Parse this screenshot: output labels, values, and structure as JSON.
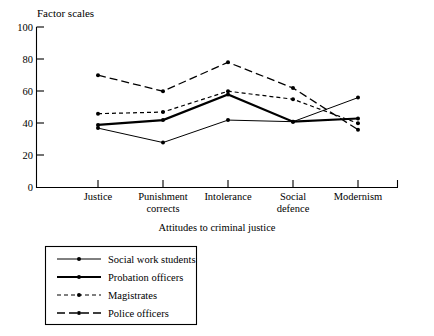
{
  "chart_data": {
    "type": "line",
    "title": "",
    "ylabel": "Factor scales",
    "xlabel": "Attitudes to criminal justice",
    "ylim": [
      0,
      100
    ],
    "yticks": [
      0,
      20,
      40,
      60,
      80,
      100
    ],
    "ytick_labels": [
      "0",
      "20",
      "40",
      "60",
      "80",
      "100"
    ],
    "grid": false,
    "legend_position": "below-left",
    "categories": [
      "Justice",
      "Punishment corrects",
      "Intolerance",
      "Social defence",
      "Modernism"
    ],
    "category_lines": [
      [
        "Justice"
      ],
      [
        "Punishment",
        "corrects"
      ],
      [
        "Intolerance"
      ],
      [
        "Social",
        "defence"
      ],
      [
        "Modernism"
      ]
    ],
    "series": [
      {
        "name": "Social work students",
        "style": "solid-thin",
        "values": [
          37,
          28,
          42,
          41,
          56
        ]
      },
      {
        "name": "Probation officers",
        "style": "solid-thick",
        "values": [
          39,
          42,
          58,
          41,
          43
        ]
      },
      {
        "name": "Magistrates",
        "style": "dashed-short",
        "values": [
          46,
          47,
          60,
          55,
          40
        ]
      },
      {
        "name": "Police officers",
        "style": "dashed-long",
        "values": [
          70,
          60,
          78,
          62,
          36
        ]
      }
    ]
  },
  "legend": {
    "entries": [
      {
        "label": "Social work students"
      },
      {
        "label": "Probation officers"
      },
      {
        "label": "Magistrates"
      },
      {
        "label": "Police officers"
      }
    ]
  },
  "colors": {
    "ink": "#000000",
    "background": "#ffffff"
  }
}
